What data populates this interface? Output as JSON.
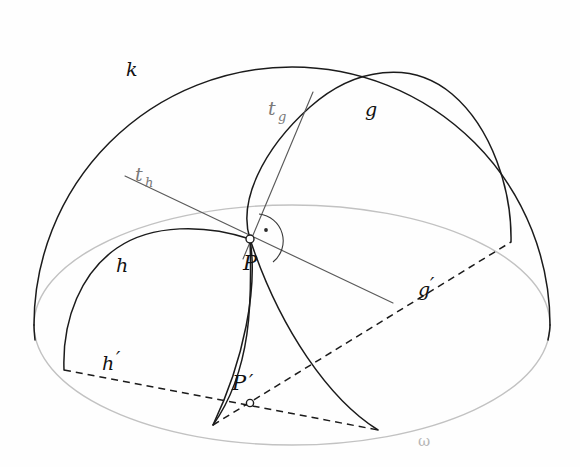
{
  "figure": {
    "background_color": "#fefefe",
    "width": 580,
    "height": 467,
    "colors": {
      "ink": "#1b1b1b",
      "equator_gray": "#c2c2c2",
      "tangent_gray": "#5a5a5a",
      "faint_label": "#8d8d8d",
      "omega_label": "#b6b6b6"
    }
  },
  "labels": {
    "sphere_outline": "k",
    "arc_g": "g",
    "arc_h": "h",
    "tangent_g": "t",
    "tangent_g_sub": "g",
    "tangent_h": "t",
    "tangent_h_sub": "h",
    "point_p": "P",
    "point_p_prime": "P",
    "point_p_prime_mark": "′",
    "projection_g": "g",
    "projection_g_mark": "′",
    "projection_h": "h",
    "projection_h_mark": "′",
    "equator": "ω"
  },
  "geometry": {
    "sphere": {
      "center_x": 292,
      "center_y": 325,
      "radius": 258
    },
    "equator": {
      "center_x": 292,
      "center_y": 325,
      "rx": 258,
      "ry": 120
    },
    "point_P": {
      "x": 250,
      "y": 239
    },
    "point_P_prime": {
      "x": 250,
      "y": 403
    },
    "arc_h_base_left": {
      "x": 64,
      "y": 370
    },
    "arc_h_base_right": {
      "x": 213,
      "y": 425
    },
    "arc_g_base_left": {
      "x": 378,
      "y": 430
    },
    "arc_g_base_right": {
      "x": 511,
      "y": 242
    },
    "tangent_g_end": {
      "x": 313,
      "y": 92
    },
    "tangent_h_start": {
      "x": 125,
      "y": 176
    },
    "tangent_h_end": {
      "x": 393,
      "y": 303
    },
    "right_angle_marker": {
      "x": 265,
      "y": 229,
      "radius": 26
    }
  },
  "label_positions": {
    "k": {
      "x": 126,
      "y": 76
    },
    "g": {
      "x": 365,
      "y": 116
    },
    "h": {
      "x": 116,
      "y": 272
    },
    "t_g": {
      "x": 270,
      "y": 115
    },
    "t_h": {
      "x": 137,
      "y": 181
    },
    "P": {
      "x": 250,
      "y": 268
    },
    "P_prime": {
      "x": 238,
      "y": 390
    },
    "g_prime": {
      "x": 423,
      "y": 296
    },
    "h_prime": {
      "x": 107,
      "y": 370
    },
    "omega": {
      "x": 423,
      "y": 442
    }
  }
}
